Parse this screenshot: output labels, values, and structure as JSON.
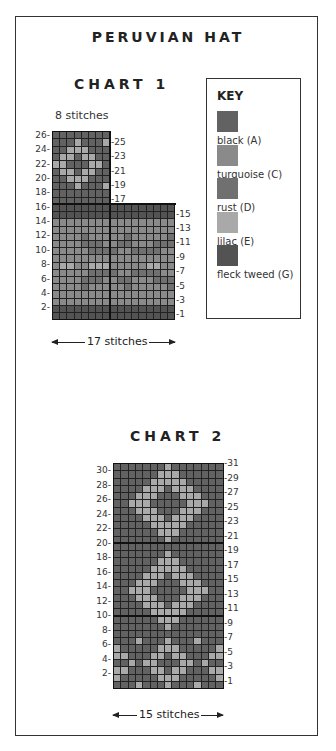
{
  "title": "PERUVIAN HAT",
  "colors": {
    "A": "#626262",
    "C": "#8a8a8a",
    "D": "#707070",
    "E": "#a9a9a9",
    "G": "#535353"
  },
  "key": {
    "heading": "KEY",
    "items": [
      {
        "code": "A",
        "label": "black (A)",
        "color": "#626262"
      },
      {
        "code": "C",
        "label": "turquoise (C)",
        "color": "#8a8a8a"
      },
      {
        "code": "D",
        "label": "rust (D)",
        "color": "#707070"
      },
      {
        "code": "E",
        "label": "lilac (E)",
        "color": "#a9a9a9"
      },
      {
        "code": "G",
        "label": "fleck tweed (G)",
        "color": "#535353"
      }
    ]
  },
  "chart1": {
    "title": "CHART 1",
    "top_width_label": "8 stitches",
    "bottom_width_label": "17 stitches",
    "top_rows": [
      "AAAAAAAA",
      "AAAEAAAE",
      "AAEEEAAA",
      "AEEAEEAA",
      "EEAAAEEA",
      "AEEAEEAA",
      "AAEEEAAA",
      "AAAEAAAE",
      "AAAAAAAA",
      "AAAAAAAA"
    ],
    "top_row_numbers": [
      26,
      25,
      24,
      23,
      22,
      21,
      20,
      19,
      18,
      17
    ],
    "bottom_rows": [
      "GGGGGGGGGGGGGGGGG",
      "GGGGGGGGGGGGGGGGG",
      "CCCCCCCCCCCCCCCCC",
      "CCCCCCCCCCCCCCCCC",
      "CCCCDCCCCCDCCCCCD",
      "CCCCDDDCCDDCCCDDD",
      "CCCCCDDDDCCDDDDCC",
      "CCCCCCCCCCCCCCCCC",
      "CEECCEEECCCCCEECC",
      "CCCCCDDDDCCDDDDCC",
      "CCCCDDDCCDDCCCDDD",
      "CCCCDCCCCCDCCCCCD",
      "CCCCCCCCCCCCCCCCC",
      "CCCCCCCCCCCCCCCCC",
      "GGGGGGGGGGGGGGGGG",
      "GGGGGGGGGGGGGGGGG"
    ],
    "bottom_row_numbers": [
      16,
      15,
      14,
      13,
      12,
      11,
      10,
      9,
      8,
      7,
      6,
      5,
      4,
      3,
      2,
      1
    ],
    "left_labels": [
      "26-",
      "24-",
      "22-",
      "20-",
      "18-",
      "16-",
      "14-",
      "12-",
      "10-",
      "8-",
      "6-",
      "4-",
      "2-"
    ],
    "right_labels": [
      "-25",
      "-23",
      "-21",
      "-19",
      "-17",
      "-15",
      "-13",
      "-11",
      "-9",
      "-7",
      "-5",
      "-3",
      "-1"
    ]
  },
  "chart2": {
    "title": "CHART 2",
    "width_label": "15 stitches",
    "rows": [
      "AAAAAAAEAAAAAAA",
      "AAAAAAEEEAAAAAA",
      "AAAAAEEEEEAAAAA",
      "AAAAEEEAEEEAAAA",
      "AAAEEEAAAEEEAAA",
      "AAEEEAAAAAEEEAA",
      "AAAEEEAAAEEEAAA",
      "AAAAEEEAEEEAAAA",
      "AAAAAEEEEEAAAAA",
      "AAAAAAEEEAAAAAA",
      "AAAAAAAEAAAAAAA",
      "AAAAAAAAAAAAAAA",
      "AAAAAAAEAAAAAAA",
      "AAAAAAEEEAAAAAA",
      "AAAAAEEEEEAAAAA",
      "AAAAEEEAEEEAAAA",
      "AAAEEEAAAEEEAAA",
      "AAEEEAAAAAEEEAA",
      "AAAEEEAAAEEEAAA",
      "AAAAEEEAEEEAAAA",
      "AAAAAEEEEEAAAAA",
      "AAAAAAEEEAAAAAA",
      "AAAAAAAEAAAAAAA",
      "AAAAAAAAAAAAAAA",
      "AAAEAAAEAAAEAAA",
      "EAAAAAEEEAAAAAE",
      "EEAAAEEAEEAAAEE",
      "AAEAEEAAAEEAEAA",
      "EEAAAEEAEEAAAEE",
      "EAAAAAEEEAAAAAE",
      "AAAEAAAEAAAEAAA"
    ],
    "left_labels": [
      "30-",
      "28-",
      "26-",
      "24-",
      "22-",
      "20-",
      "18-",
      "16-",
      "14-",
      "12-",
      "10-",
      "8-",
      "6-",
      "4-",
      "2-"
    ],
    "right_labels": [
      "-31",
      "-29",
      "-27",
      "-25",
      "-23",
      "-21",
      "-19",
      "-17",
      "-15",
      "-13",
      "-11",
      "-9",
      "-7",
      "-5",
      "-3",
      "-1"
    ]
  }
}
